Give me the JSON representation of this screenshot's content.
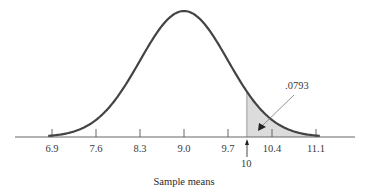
{
  "chart_data": {
    "type": "area",
    "title": "",
    "xlabel": "Sample means",
    "ylabel": "",
    "distribution": "normal",
    "mean": 9.0,
    "sd": 0.7,
    "xlim": [
      6.9,
      11.1
    ],
    "tick_labels": [
      "6.9",
      "7.6",
      "8.3",
      "9.0",
      "9.7",
      "10.4",
      "11.1"
    ],
    "ticks": [
      6.9,
      7.6,
      8.3,
      9.0,
      9.7,
      10.4,
      11.1
    ],
    "shaded_region": {
      "from": 10,
      "to": 11.1,
      "label": ".0793"
    },
    "marker": {
      "value": 10,
      "label": "10"
    },
    "grid": false,
    "legend": null
  },
  "labels": {
    "xlabel": "Sample means",
    "area_annotation": ".0793",
    "marker_label": "10"
  },
  "colors": {
    "curve": "#444444",
    "axis": "#666666",
    "shade": "#dcdcdc"
  }
}
